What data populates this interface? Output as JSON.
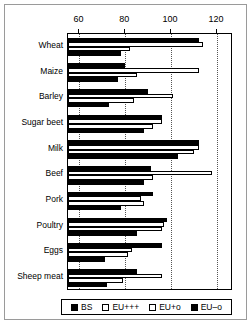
{
  "chart_data": {
    "type": "bar",
    "orientation": "horizontal",
    "title": "",
    "xlabel": "",
    "ylabel": "",
    "xlim": [
      55,
      127
    ],
    "xticks": [
      60,
      80,
      100,
      120
    ],
    "xtick_labels": [
      "60",
      "80",
      "100",
      "120"
    ],
    "grid": true,
    "grid_axis": "x",
    "legend_position": "bottom",
    "categories": [
      "Wheat",
      "Maize",
      "Barley",
      "Sugar beet",
      "Milk",
      "Beef",
      "Pork",
      "Poultry",
      "Eggs",
      "Sheep meat"
    ],
    "series": [
      {
        "name": "BS",
        "fill": "solid-black",
        "color": "#000000",
        "values": [
          112,
          80,
          90,
          96,
          112,
          91,
          92,
          98,
          96,
          85
        ]
      },
      {
        "name": "EU+++",
        "fill": "white",
        "color": "#ffffff",
        "values": [
          114,
          112,
          101,
          96,
          112,
          118,
          87,
          97,
          83,
          96
        ]
      },
      {
        "name": "EU+o",
        "fill": "checker-light",
        "color": "#b8b8b8",
        "values": [
          82,
          85,
          84,
          92,
          110,
          92,
          88,
          96,
          81,
          79
        ]
      },
      {
        "name": "EU–o",
        "fill": "checker-dark",
        "color": "#3a3a3a",
        "values": [
          78,
          77,
          73,
          88,
          103,
          88,
          78,
          85,
          71,
          72
        ]
      }
    ]
  },
  "legend": {
    "items": [
      {
        "label": "BS"
      },
      {
        "label": "EU+++"
      },
      {
        "label": "EU+o"
      },
      {
        "label": "EU–o"
      }
    ]
  }
}
